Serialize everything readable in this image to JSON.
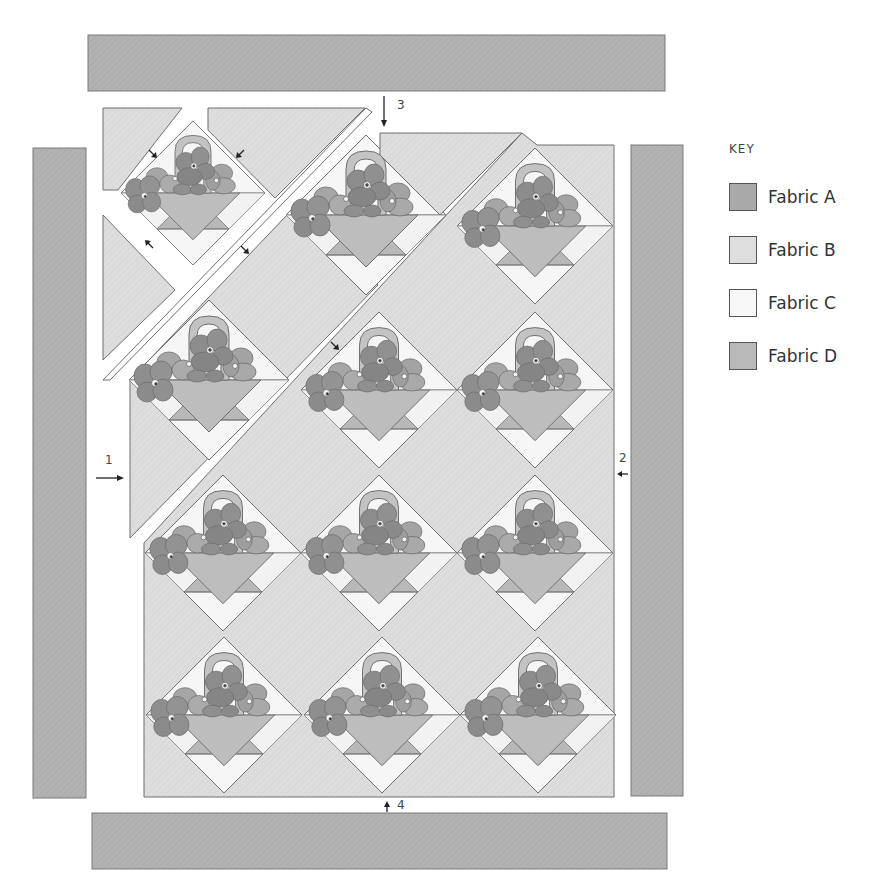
{
  "diagram": {
    "step_labels": [
      {
        "id": "1",
        "text": "1",
        "direction": "right"
      },
      {
        "id": "2",
        "text": "2",
        "direction": "left"
      },
      {
        "id": "3",
        "text": "3",
        "direction": "down"
      },
      {
        "id": "4",
        "text": "4",
        "direction": "up"
      }
    ],
    "borders": [
      "top",
      "left",
      "right",
      "bottom"
    ],
    "block_count": 12
  },
  "key": {
    "title": "KEY",
    "items": [
      {
        "label": "Fabric A",
        "color": "#a9a9a9"
      },
      {
        "label": "Fabric B",
        "color": "#dedede"
      },
      {
        "label": "Fabric C",
        "color": "#f8f8f8"
      },
      {
        "label": "Fabric D",
        "color": "#b9b9b9"
      }
    ]
  },
  "colors": {
    "border_fabric": "#b3b3b3",
    "background_fabric": "#dcdcdc",
    "light_fabric": "#f5f5f5",
    "flower_dark": "#8e8e8e",
    "flower_mid": "#a8a8a8",
    "basket": "#bdbdbd",
    "outline": "#6f6f6f"
  }
}
